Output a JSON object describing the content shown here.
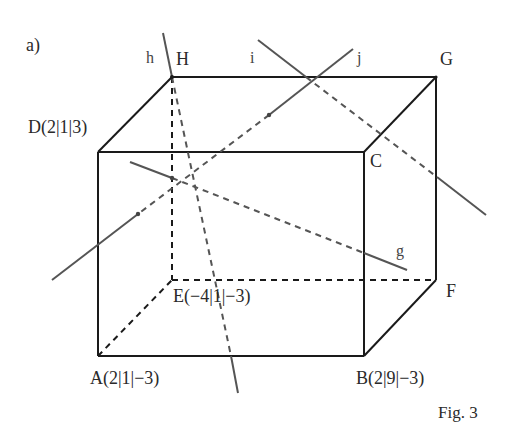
{
  "part_label": "a)",
  "figure_caption": "Fig. 3",
  "vertices": {
    "A": {
      "label": "A(2|1|−3)",
      "coords": [
        2,
        1,
        -3
      ]
    },
    "B": {
      "label": "B(2|9|−3)",
      "coords": [
        2,
        9,
        -3
      ]
    },
    "C": {
      "label": "C"
    },
    "D": {
      "label": "D(2|1|3)",
      "coords": [
        2,
        1,
        3
      ]
    },
    "E": {
      "label": "E(−4|1|−3)",
      "coords": [
        -4,
        1,
        -3
      ]
    },
    "F": {
      "label": "F"
    },
    "G": {
      "label": "G"
    },
    "H": {
      "label": "H"
    }
  },
  "lines": {
    "g": {
      "label": "g"
    },
    "h": {
      "label": "h"
    },
    "i": {
      "label": "i"
    },
    "j": {
      "label": "j"
    }
  },
  "colors": {
    "edge": "#1a1a1a",
    "line": "#555555",
    "text": "#2a2a2a"
  }
}
